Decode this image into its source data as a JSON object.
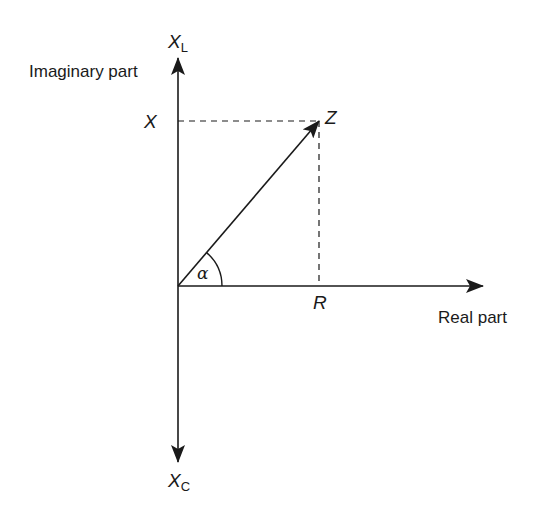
{
  "diagram": {
    "type": "impedance-phasor",
    "colors": {
      "ink": "#1a1a1a",
      "background": "#ffffff"
    },
    "axes": {
      "vertical_positive": {
        "symbol": "X",
        "subscript": "L",
        "label": "Imaginary part"
      },
      "vertical_negative": {
        "symbol": "X",
        "subscript": "C"
      },
      "horizontal": {
        "label": "Real part"
      }
    },
    "phasor": {
      "label": "Z"
    },
    "projections": {
      "imaginary": {
        "label": "X"
      },
      "real": {
        "label": "R"
      }
    },
    "angle": {
      "label": "α"
    }
  }
}
